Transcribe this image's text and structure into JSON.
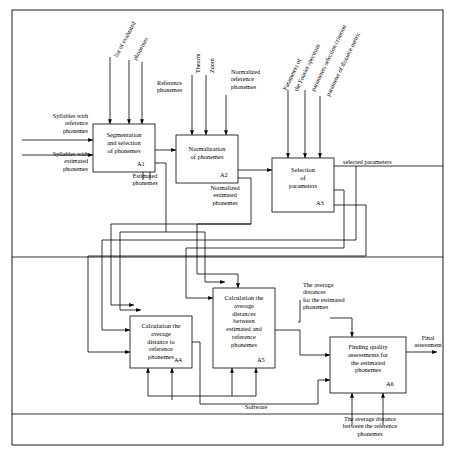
{
  "diagram": {
    "boxes": [
      {
        "id": "A1",
        "label": "Segmentation\nand selection\nof phonemes",
        "code": "A1"
      },
      {
        "id": "A2",
        "label": "Normalization\nof phonemes",
        "code": "A2"
      },
      {
        "id": "A3",
        "label": "Selection\nof\nparameters",
        "code": "A3"
      },
      {
        "id": "A4",
        "label": "Calculation the\naverage\ndistance to\nreference\nphonemes",
        "code": "A4"
      },
      {
        "id": "A5",
        "label": "Calculation the\naverage\ndistances\nbetween\nestimated and\nreference\nphonemes",
        "code": "A5"
      },
      {
        "id": "A6",
        "label": "Finding quality\nassessments for\nthe estimated\nphonemes",
        "code": "A6"
      }
    ],
    "inputs": [
      {
        "id": "in1",
        "text": "Syllables with\nreference\nphonemes"
      },
      {
        "id": "in2",
        "text": "Syllables with\nestimated\nphonemes"
      }
    ],
    "controls": [
      {
        "id": "c1",
        "text": "list of evaluated\nphonemes"
      },
      {
        "id": "c2",
        "text": "Reference\nphonemes"
      },
      {
        "id": "c3",
        "text": "Theorem"
      },
      {
        "id": "c4",
        "text": "Zoom"
      },
      {
        "id": "c5",
        "text": "Normalized\nreference\nphonemes"
      },
      {
        "id": "c6",
        "text": "Parameters of\nthe Fourier spectrum"
      },
      {
        "id": "c7",
        "text": "parameters selection criterion"
      },
      {
        "id": "c8",
        "text": "parameter of distance metric"
      }
    ],
    "flows": [
      {
        "id": "f1",
        "text": "Estimated\nphonemes"
      },
      {
        "id": "f2",
        "text": "Normalized\nestimated\nphonemes"
      },
      {
        "id": "f3",
        "text": "selected parameters"
      },
      {
        "id": "f4",
        "text": "The average\ndistances\nfor the estimated\nphonemes"
      },
      {
        "id": "f5",
        "text": "Final\nassessment"
      },
      {
        "id": "f6",
        "text": "The average distance\nbetween the reference\nphonemes"
      },
      {
        "id": "f7",
        "text": "Software"
      }
    ]
  }
}
